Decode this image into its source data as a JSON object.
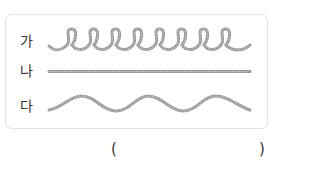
{
  "items": [
    {
      "label": "가",
      "shape": "coiled-loops",
      "loop_count": 8
    },
    {
      "label": "나",
      "shape": "straight-line"
    },
    {
      "label": "다",
      "shape": "wavy-line",
      "crest_count": 3
    }
  ],
  "answer": {
    "open_paren": "(",
    "close_paren": ")",
    "value": ""
  },
  "colors": {
    "rope": "#9a9a9a",
    "rope_dots": "#c8c8c8",
    "border": "#e2e2e2"
  }
}
